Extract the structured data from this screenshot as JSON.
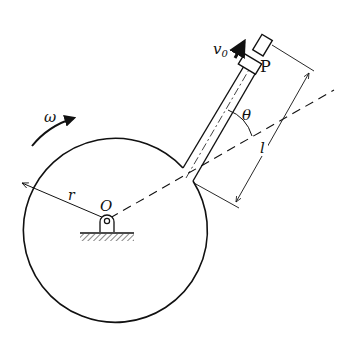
{
  "diagram": {
    "labels": {
      "omega": "ω",
      "v0_base": "v",
      "v0_sub": "0",
      "point_P": "P",
      "theta": "θ",
      "length": "l",
      "radius": "r",
      "center_O": "O"
    },
    "colors": {
      "ink": "#111111",
      "background": "#ffffff"
    }
  }
}
